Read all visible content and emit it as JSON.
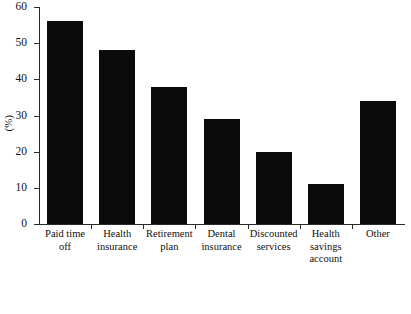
{
  "chart_data": {
    "type": "bar",
    "title": "",
    "xlabel": "",
    "ylabel": "(%)",
    "ylim": [
      0,
      60
    ],
    "yticks": [
      0,
      10,
      20,
      30,
      40,
      50,
      60
    ],
    "grid": false,
    "legend": "none",
    "bar_color": "#0b0b0b",
    "axis_color": "#2a2a2a",
    "categories": [
      "Paid time\noff",
      "Health\ninsurance",
      "Retirement\nplan",
      "Dental\ninsurance",
      "Discounted\nservices",
      "Health\nsavings\naccount",
      "Other"
    ],
    "values": [
      56,
      48,
      38,
      29,
      20,
      11,
      34
    ],
    "series": [
      {
        "name": "Percent of employers offering benefit",
        "values": [
          56,
          48,
          38,
          29,
          20,
          11,
          34
        ]
      }
    ]
  },
  "axis": {
    "y_title": "(%)",
    "y_tick_labels": [
      "60",
      "50",
      "40",
      "30",
      "20",
      "10",
      "0"
    ]
  }
}
